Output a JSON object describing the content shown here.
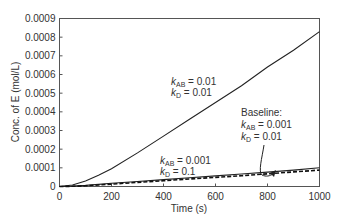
{
  "chart_data": {
    "type": "line",
    "title": "",
    "xlabel": "Time (s)",
    "ylabel": "Conc. of E (mol/L)",
    "xlim": [
      0,
      1000
    ],
    "ylim": [
      0,
      0.0009
    ],
    "xticks": [
      "0",
      "200",
      "400",
      "600",
      "800",
      "1000"
    ],
    "yticks": [
      "0",
      "0.0001",
      "0.0002",
      "0.0003",
      "0.0004",
      "0.0005",
      "0.0006",
      "0.0007",
      "0.0008",
      "0.0009"
    ],
    "grid": false,
    "legend": "none (inline annotations)",
    "x": [
      0,
      50,
      100,
      150,
      200,
      300,
      400,
      500,
      600,
      700,
      800,
      900,
      1000
    ],
    "series": [
      {
        "name": "kAB = 0.01, kD = 0.01",
        "style": "solid",
        "values": [
          0,
          8e-06,
          3e-05,
          6e-05,
          9.5e-05,
          0.00018,
          0.00027,
          0.00036,
          0.00045,
          0.00054,
          0.00064,
          0.00073,
          0.00083
        ]
      },
      {
        "name": "kAB = 0.001, kD = 0.1",
        "style": "solid",
        "values": [
          0,
          2e-06,
          6e-06,
          1.1e-05,
          1.7e-05,
          2.7e-05,
          3.7e-05,
          4.7e-05,
          5.7e-05,
          6.7e-05,
          7.7e-05,
          8.8e-05,
          0.0001
        ]
      },
      {
        "name": "Baseline: kAB = 0.001, kD = 0.01",
        "style": "dashed",
        "values": [
          0,
          1e-06,
          4e-06,
          8e-06,
          1.3e-05,
          2.2e-05,
          3.1e-05,
          4e-05,
          4.9e-05,
          5.8e-05,
          6.8e-05,
          7.8e-05,
          8.8e-05
        ]
      }
    ],
    "annotations": [
      {
        "label_line1": "kAB = 0.01",
        "label_line2": "kD = 0.01"
      },
      {
        "label_line1": "kAB = 0.001",
        "label_line2": "kD = 0.1"
      },
      {
        "header": "Baseline:",
        "label_line1": "kAB = 0.001",
        "label_line2": "kD = 0.01"
      }
    ]
  },
  "labels": {
    "xlabel": "Time (s)",
    "ylabel": "Conc. of E (mol/L)",
    "ann1_k1": "k",
    "ann1_s1": "AB",
    "ann1_v1": " = 0.01",
    "ann1_k2": "k",
    "ann1_s2": "D",
    "ann1_v2": " = 0.01",
    "ann2_k1": "k",
    "ann2_s1": "AB",
    "ann2_v1": " = 0.001",
    "ann2_k2": "k",
    "ann2_s2": "D",
    "ann2_v2": " = 0.1",
    "ann3_head": "Baseline:",
    "ann3_k1": "k",
    "ann3_s1": "AB",
    "ann3_v1": " = 0.001",
    "ann3_k2": "k",
    "ann3_s2": "D",
    "ann3_v2": " = 0.01"
  }
}
